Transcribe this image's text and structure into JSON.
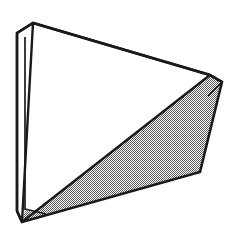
{
  "figure": {
    "background_color": "#ffffff",
    "line_color": "#1a1a1a",
    "shaded_fill_color": "#808080",
    "white_fill_color": "#ffffff"
  },
  "geometry": {
    "canvas": {
      "width": 232,
      "height": 239
    },
    "stroke_width_outer": 2.6,
    "stroke_width_inner": 1.7,
    "vertices": {
      "front_top_left": [
        33,
        23
      ],
      "front_right": [
        210,
        75
      ],
      "front_bottom_left": [
        22,
        222
      ],
      "back_top_left": [
        17,
        33
      ],
      "back_right": [
        222,
        82
      ],
      "back_bottom_left": [
        17,
        211
      ],
      "inner_top_left": [
        25,
        37
      ],
      "inner_bottom_left": [
        25,
        210
      ],
      "shaded_right_low": [
        200,
        172
      ]
    },
    "faces": [
      {
        "name": "front-triangle-face",
        "fill": "white",
        "points": "33,23 210,75 22,222"
      },
      {
        "name": "top-edge-band",
        "fill": "white",
        "points": "33,23 210,75 222,82 17,33"
      },
      {
        "name": "left-edge-band",
        "fill": "white",
        "points": "17,33 33,23 22,222 17,211"
      },
      {
        "name": "left-inner-band",
        "fill": "white",
        "points": "25,37 33,23 22,222 25,210"
      },
      {
        "name": "lower-right-shaded-face",
        "fill": "dither",
        "points": "210,75 222,82 200,172 22,222"
      },
      {
        "name": "right-corner-sliver",
        "fill": "dither",
        "points": "210,75 222,82 213,96"
      },
      {
        "name": "bottom-corner-sliver",
        "fill": "dither",
        "points": "22,222 25,210 45,214"
      }
    ],
    "edges": [
      {
        "name": "front-top-edge",
        "from": "front_top_left",
        "to": "front_right",
        "weight": "outer"
      },
      {
        "name": "back-top-edge",
        "from": "back_top_left",
        "to": "back_right",
        "weight": "outer"
      },
      {
        "name": "top-left-cap-edge",
        "from": "back_top_left",
        "to": "front_top_left",
        "weight": "outer"
      },
      {
        "name": "right-cap-edge",
        "from": "front_right",
        "to": "back_right",
        "weight": "outer"
      },
      {
        "name": "left-outer-vertical",
        "from": "back_top_left",
        "to": "back_bottom_left",
        "weight": "outer"
      },
      {
        "name": "left-inner-vertical",
        "from": "inner_top_left",
        "to": "inner_bottom_left",
        "weight": "inner"
      },
      {
        "name": "left-front-edge",
        "from": "front_top_left",
        "to": "front_bottom_left",
        "weight": "outer"
      },
      {
        "name": "bottom-left-cap-edge",
        "from": "back_bottom_left",
        "to": "front_bottom_left",
        "weight": "outer"
      },
      {
        "name": "front-diagonal-edge",
        "from": "front_bottom_left",
        "to": "front_right",
        "weight": "outer"
      },
      {
        "name": "shaded-lower-edge",
        "from": "front_bottom_left",
        "to": "shaded_right_low",
        "weight": "outer"
      },
      {
        "name": "shaded-right-edge",
        "from": "shaded_right_low",
        "to": "back_right",
        "weight": "outer"
      }
    ]
  }
}
